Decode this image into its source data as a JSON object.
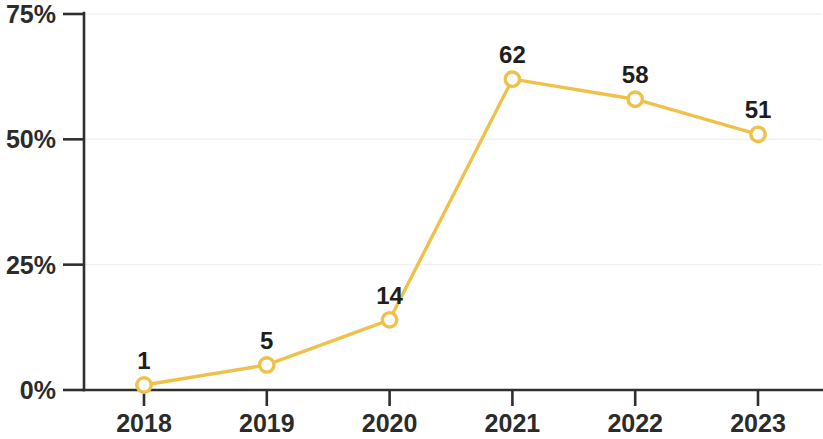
{
  "chart_data": {
    "type": "line",
    "title": "",
    "subtitle": "",
    "xlabel": "",
    "ylabel": "",
    "categories": [
      "2018",
      "2019",
      "2020",
      "2021",
      "2022",
      "2023"
    ],
    "values": [
      1,
      5,
      14,
      62,
      58,
      51
    ],
    "point_labels": [
      "1",
      "5",
      "14",
      "62",
      "58",
      "51"
    ],
    "series": [
      {
        "name": "",
        "values": [
          1,
          5,
          14,
          62,
          58,
          51
        ],
        "color": "#EFC14A",
        "marker": "open-circle",
        "marker_fill": "#ffffff"
      }
    ],
    "ylim": [
      0,
      75
    ],
    "y_ticks": [
      0,
      25,
      50,
      75
    ],
    "y_tick_labels": [
      "0%",
      "25%",
      "50%",
      "75%"
    ],
    "x_tick_labels": [
      "2018",
      "2019",
      "2020",
      "2021",
      "2022",
      "2023"
    ],
    "grid": true,
    "grid_axis": "y",
    "legend": false,
    "legend_position": "none",
    "value_labels_shown": true,
    "colors": {
      "line": "#EFC14A",
      "marker_stroke": "#EFC14A",
      "marker_fill": "#ffffff",
      "axis": "#2f2f2f",
      "text": "#1e1e1e",
      "grid": "#eef0f3",
      "background": "#ffffff"
    }
  },
  "axes": {
    "y_axis_name": "y-axis",
    "x_axis_name": "x-axis"
  }
}
